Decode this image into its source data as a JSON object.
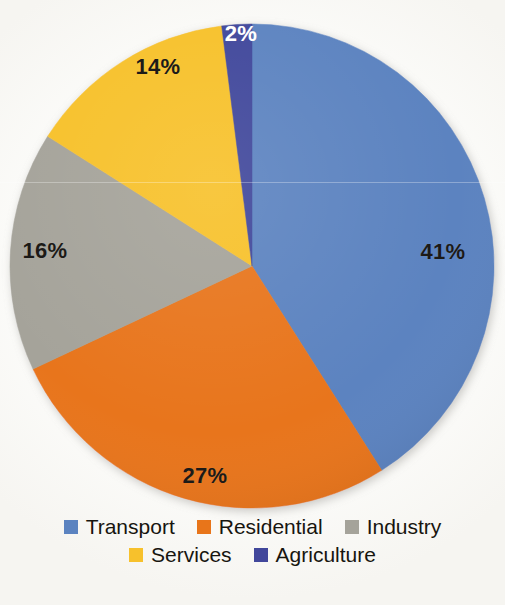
{
  "chart_data": {
    "type": "pie",
    "title": "",
    "subtitle": "",
    "xlabel": "",
    "ylabel": "",
    "legend_position": "bottom",
    "grid": false,
    "value_unit": "%",
    "start_angle_deg": 0,
    "direction": "clockwise",
    "categories": [
      "Transport",
      "Residential",
      "Industry",
      "Services",
      "Agriculture"
    ],
    "values": [
      41,
      27,
      16,
      14,
      2
    ],
    "labels": [
      "41%",
      "27%",
      "16%",
      "14%",
      "2%"
    ],
    "colors": [
      "#5b83c0",
      "#e8751a",
      "#a5a39a",
      "#f7c12c",
      "#41479b"
    ],
    "slices": [
      {
        "name": "Transport",
        "value": 41,
        "label": "41%",
        "color": "#5b83c0",
        "label_color": "#1c1a17",
        "label_x": 443,
        "label_y": 252
      },
      {
        "name": "Residential",
        "value": 27,
        "label": "27%",
        "color": "#e8751a",
        "label_color": "#1c1a17",
        "label_x": 205,
        "label_y": 476
      },
      {
        "name": "Industry",
        "value": 16,
        "label": "16%",
        "color": "#a5a39a",
        "label_color": "#1c1a17",
        "label_x": 45,
        "label_y": 251
      },
      {
        "name": "Services",
        "value": 14,
        "label": "14%",
        "color": "#f7c12c",
        "label_color": "#1c1a17",
        "label_x": 158,
        "label_y": 67
      },
      {
        "name": "Agriculture",
        "value": 2,
        "label": "2%",
        "color": "#41479b",
        "label_color": "#ffffff",
        "label_x": 241,
        "label_y": 34
      }
    ]
  },
  "legend": {
    "rows": [
      [
        {
          "label": "Transport",
          "color": "#5b83c0"
        },
        {
          "label": "Residential",
          "color": "#e8751a"
        },
        {
          "label": "Industry",
          "color": "#a5a39a"
        }
      ],
      [
        {
          "label": "Services",
          "color": "#f7c12c"
        },
        {
          "label": "Agriculture",
          "color": "#41479b"
        }
      ]
    ]
  },
  "geometry": {
    "center_x": 252,
    "center_y": 266,
    "radius": 242
  }
}
